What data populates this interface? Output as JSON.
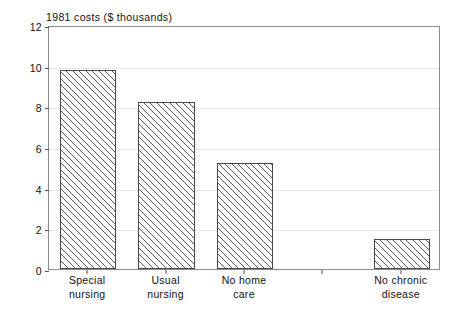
{
  "chart_data": {
    "type": "bar",
    "title": "1981 costs ($ thousands)",
    "xlabel": "",
    "ylabel": "",
    "ylim": [
      0,
      12
    ],
    "yticks": [
      0,
      2,
      4,
      6,
      8,
      10,
      12
    ],
    "ytick_labels": [
      "0",
      "2",
      "4",
      "6",
      "8",
      "10",
      "12"
    ],
    "grid": true,
    "legend": false,
    "categories": [
      "Special nursing",
      "Usual nursing",
      "No home care",
      "",
      "No chronic disease"
    ],
    "category_lines": [
      [
        "Special",
        "nursing"
      ],
      [
        "Usual",
        "nursing"
      ],
      [
        "No home",
        "care"
      ],
      [
        "",
        ""
      ],
      [
        "No chronic",
        "disease"
      ]
    ],
    "values": [
      9.8,
      8.2,
      5.2,
      null,
      1.5
    ],
    "series": [
      {
        "name": "1981 costs",
        "values": [
          9.8,
          8.2,
          5.2,
          null,
          1.5
        ]
      }
    ],
    "bar_fill": "hatched-diagonal",
    "bar_edge_color": "#4a4a4a",
    "grid_color": "#e6e6e6",
    "frame_color": "#8a8a8a",
    "text_color": "#111111",
    "background": "#ffffff"
  }
}
